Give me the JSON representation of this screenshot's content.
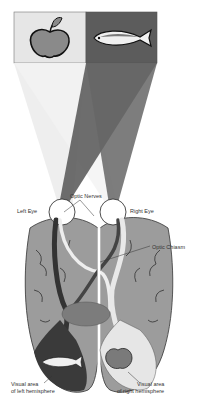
{
  "diagram": {
    "type": "visual-pathway",
    "labels": {
      "optic_nerves": "Optic Nerves",
      "left_eye": "Left Eye",
      "right_eye": "Right Eye",
      "optic_chiasm": "Optic Chiasm",
      "visual_left_1": "Visual area",
      "visual_left_2": "of left hemisphere",
      "visual_right_1": "Visual area",
      "visual_right_2": "of right hemisphere"
    },
    "objects": [
      "apple",
      "fish"
    ],
    "colors": {
      "left_field": "#e6e6e6",
      "right_field": "#5a5a5a",
      "brain": "#9a9a9a",
      "dark_path": "#3a3a3a",
      "light_path": "#e8e8e8",
      "thalamus": "#7a7a7a"
    }
  }
}
